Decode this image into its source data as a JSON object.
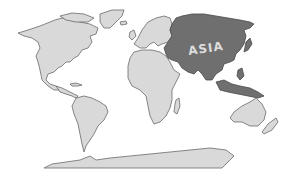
{
  "map": {
    "title": "World map highlighting Asia",
    "highlighted_region": "Asia",
    "label": "ASIA",
    "colors": {
      "background": "#ffffff",
      "land_fill": "#d9d9d9",
      "land_stroke": "#6a6a6a",
      "highlight_fill": "#6f6f6f",
      "highlight_stroke": "#4a4a4a",
      "label_color": "#dcdcdc"
    },
    "regions": [
      {
        "name": "North America",
        "highlighted": false
      },
      {
        "name": "Greenland",
        "highlighted": false
      },
      {
        "name": "South America",
        "highlighted": false
      },
      {
        "name": "Europe",
        "highlighted": false
      },
      {
        "name": "Africa",
        "highlighted": false
      },
      {
        "name": "Asia",
        "highlighted": true
      },
      {
        "name": "Australia",
        "highlighted": false
      },
      {
        "name": "New Zealand",
        "highlighted": false
      },
      {
        "name": "Antarctica",
        "highlighted": false
      }
    ]
  }
}
